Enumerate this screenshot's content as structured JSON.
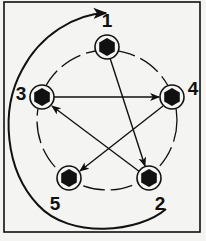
{
  "diagram": {
    "type": "rotation-sequence",
    "colors": {
      "ink": "#111111",
      "paper": "#f4f4f2"
    },
    "frame": {
      "x": 4,
      "y": 2,
      "w": 196,
      "h": 230
    },
    "circle": {
      "cx": 107,
      "cy": 120,
      "r": 70
    },
    "nodes": [
      {
        "id": "1",
        "label": "1",
        "x": 107,
        "y": 47,
        "lx": 107,
        "ly": 27
      },
      {
        "id": "2",
        "label": "2",
        "x": 149,
        "y": 178,
        "lx": 160,
        "ly": 210
      },
      {
        "id": "3",
        "label": "3",
        "x": 42,
        "y": 97,
        "lx": 21,
        "ly": 100
      },
      {
        "id": "4",
        "label": "4",
        "x": 172,
        "y": 97,
        "lx": 193,
        "ly": 95
      },
      {
        "id": "5",
        "label": "5",
        "x": 69,
        "y": 178,
        "lx": 55,
        "ly": 210
      }
    ],
    "edges": [
      {
        "from": "1",
        "to": "2"
      },
      {
        "from": "2",
        "to": "3"
      },
      {
        "from": "3",
        "to": "4"
      },
      {
        "from": "4",
        "to": "5"
      }
    ],
    "return_arrow": {
      "from": "bottom-right",
      "to": "1",
      "direction": "counterclockwise-around-left"
    }
  }
}
